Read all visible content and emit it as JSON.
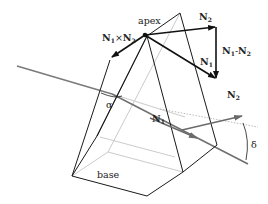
{
  "diagram": {
    "labels": {
      "apex": "apex",
      "base": "base",
      "alpha": "α",
      "delta": "δ",
      "n1_cross_n2": {
        "main": "N",
        "sub1": "1",
        "op": "×",
        "main2": "N",
        "sub2": "2"
      },
      "n2_top": {
        "main": "N",
        "sub": "2"
      },
      "n1_minus_n2": {
        "main": "N",
        "sub1": "1",
        "op": "-",
        "main2": "N",
        "sub2": "2"
      },
      "n1_right": {
        "main": "N",
        "sub": "1"
      },
      "n1_inner": {
        "main": "N",
        "sub": "1"
      },
      "n2_exit": {
        "main": "N",
        "sub": "2"
      }
    },
    "colors": {
      "prism_edges": "#1a1a1a",
      "hidden_edges": "#b8b8b8",
      "ray": "#7a7a7a",
      "vectors": "#111111",
      "reference_line": "#aaaaaa"
    }
  }
}
